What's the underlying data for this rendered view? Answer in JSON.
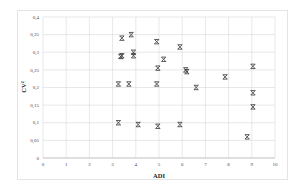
{
  "chart_data": {
    "type": "scatter",
    "title": "",
    "xlabel": "ADI",
    "ylabel": "CV²",
    "xlim": [
      0,
      10
    ],
    "ylim": [
      0,
      0.4
    ],
    "x_ticks": [
      "0",
      "1",
      "2",
      "3",
      "4",
      "5",
      "6",
      "7",
      "8",
      "9",
      "10"
    ],
    "y_ticks": [
      "0",
      "0,05",
      "0,1",
      "0,15",
      "0,2",
      "0,25",
      "0,3",
      "0,35",
      "0,4"
    ],
    "grid": true,
    "legend": null,
    "marker": "asterisk",
    "series": [
      {
        "name": "items",
        "points": [
          {
            "x": 3.4,
            "y": 0.34
          },
          {
            "x": 3.8,
            "y": 0.35
          },
          {
            "x": 3.4,
            "y": 0.29
          },
          {
            "x": 3.35,
            "y": 0.288
          },
          {
            "x": 3.9,
            "y": 0.3
          },
          {
            "x": 3.9,
            "y": 0.29
          },
          {
            "x": 3.25,
            "y": 0.21
          },
          {
            "x": 3.7,
            "y": 0.21
          },
          {
            "x": 3.25,
            "y": 0.1
          },
          {
            "x": 4.1,
            "y": 0.095
          },
          {
            "x": 4.9,
            "y": 0.33
          },
          {
            "x": 5.2,
            "y": 0.28
          },
          {
            "x": 4.9,
            "y": 0.21
          },
          {
            "x": 4.95,
            "y": 0.255
          },
          {
            "x": 5.9,
            "y": 0.315
          },
          {
            "x": 6.15,
            "y": 0.25
          },
          {
            "x": 6.2,
            "y": 0.245
          },
          {
            "x": 6.6,
            "y": 0.2
          },
          {
            "x": 4.95,
            "y": 0.09
          },
          {
            "x": 5.9,
            "y": 0.095
          },
          {
            "x": 7.85,
            "y": 0.23
          },
          {
            "x": 9.05,
            "y": 0.26
          },
          {
            "x": 9.05,
            "y": 0.185
          },
          {
            "x": 9.05,
            "y": 0.145
          },
          {
            "x": 8.8,
            "y": 0.06
          }
        ]
      }
    ]
  }
}
